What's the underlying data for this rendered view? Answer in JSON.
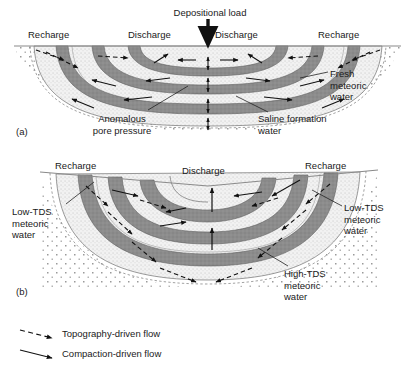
{
  "figure": {
    "panels": [
      {
        "id": "(a)",
        "id_x": 16,
        "id_y": 126,
        "kind": "compaction-driven",
        "surface_labels": [
          {
            "name": "recharge-left",
            "text": "Recharge",
            "x": 28,
            "y": 29,
            "align": "left"
          },
          {
            "name": "discharge-left",
            "text": "Discharge",
            "x": 128,
            "y": 29,
            "align": "left"
          },
          {
            "name": "discharge-right",
            "text": "Discharge",
            "x": 215,
            "y": 29,
            "align": "left"
          },
          {
            "name": "recharge-right",
            "text": "Recharge",
            "x": 318,
            "y": 29,
            "align": "left"
          }
        ],
        "load_label": {
          "text": "Depositional load",
          "x": 150,
          "y": 7,
          "w": 120
        },
        "annotations": [
          {
            "name": "anomalous-pore-pressure",
            "text": "Anomalous\npore pressure",
            "x": 74,
            "y": 113,
            "w": 96,
            "align": "center"
          },
          {
            "name": "fresh-meteoric-water",
            "text": "Fresh\nmeteoric\nwater",
            "x": 330,
            "y": 68,
            "w": 72,
            "align": "left"
          },
          {
            "name": "saline-formation-water",
            "text": "Saline formation\nwater",
            "x": 258,
            "y": 113,
            "w": 108,
            "align": "left"
          }
        ]
      },
      {
        "id": "(b)",
        "id_x": 16,
        "id_y": 286,
        "kind": "topography-driven",
        "surface_labels": [
          {
            "name": "recharge-left",
            "text": "Recharge",
            "x": 55,
            "y": 160,
            "align": "left"
          },
          {
            "name": "discharge-center",
            "text": "Discharge",
            "x": 182,
            "y": 165,
            "align": "left"
          },
          {
            "name": "recharge-right",
            "text": "Recharge",
            "x": 305,
            "y": 160,
            "align": "left"
          }
        ],
        "annotations": [
          {
            "name": "low-tds-meteoric-water-left",
            "text": "Low-TDS\nmeteoric\nwater",
            "x": 12,
            "y": 206,
            "w": 62,
            "align": "left"
          },
          {
            "name": "low-tds-meteoric-water-right",
            "text": "Low-TDS\nmeteoric\nwater",
            "x": 344,
            "y": 202,
            "w": 66,
            "align": "left"
          },
          {
            "name": "high-tds-meteoric-water",
            "text": "High-TDS\nmeteoric\nwater",
            "x": 284,
            "y": 268,
            "w": 72,
            "align": "left"
          }
        ]
      }
    ],
    "legend": {
      "items": [
        {
          "name": "topography-driven-flow",
          "text": "Topography-driven flow",
          "style": "dashed",
          "x": 62,
          "y": 320
        },
        {
          "name": "compaction-driven-flow",
          "text": "Compaction-driven flow",
          "style": "solid",
          "x": 62,
          "y": 341
        }
      ]
    },
    "colors": {
      "dark_band": "#8c8c8c",
      "light_band": "#efefef",
      "stipple_dot": "#9a9a9a",
      "outline": "#666666",
      "surface_line": "#808080",
      "arrow": "#111111",
      "text": "#1a1a1a",
      "background": "#ffffff"
    }
  }
}
